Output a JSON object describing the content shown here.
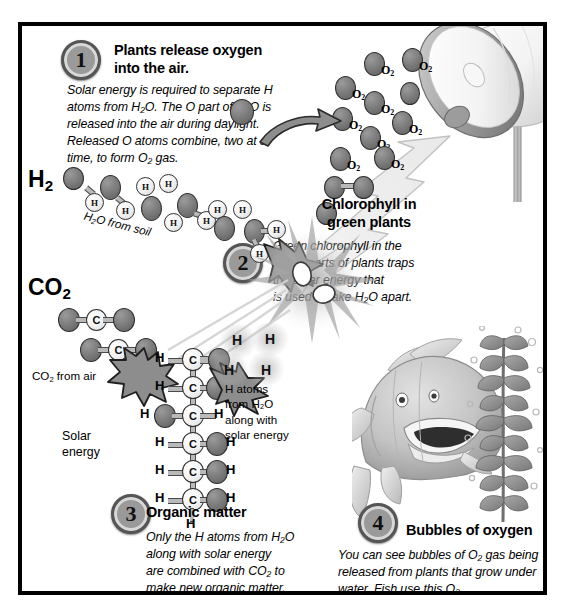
{
  "diagram": {
    "background": "#ffffff",
    "frame_color": "#000000"
  },
  "steps": [
    {
      "number": "1",
      "heading": "Plants release oxygen into the air.",
      "heading_line1": "Plants release oxygen",
      "heading_line2": "into the air.",
      "body_lines": [
        "Solar energy is required to separate H",
        "atoms from H₂O. The O part of H₂O is",
        "released into the air during daylight.",
        "Released O atoms combine, two at a",
        "time, to form O₂ gas."
      ]
    },
    {
      "number": "2",
      "heading": "Chlorophyll in green plants",
      "heading_line1": "Chlorophyll in",
      "heading_line2": "green plants",
      "body_lines": [
        "Green chlorophyll in the",
        "green parts of plants traps",
        "the solar energy that",
        "is used to take H₂O apart."
      ]
    },
    {
      "number": "3",
      "heading": "Organic matter",
      "body_lines": [
        "Only the H atoms from H₂O",
        "along with solar energy",
        "are combined with CO₂ to",
        "make new organic matter."
      ]
    },
    {
      "number": "4",
      "heading": "Bubbles of oxygen",
      "body_lines": [
        "You can see bubbles of O₂ gas being",
        "released from plants that grow under",
        "water. Fish use this O₂."
      ]
    }
  ],
  "labels": {
    "h2_label": "H₂",
    "h2_label_base": "H",
    "h2_label_sub": "2",
    "co2_label": "CO₂",
    "co2_label_base": "CO",
    "co2_label_sub": "2",
    "h2o_from_soil": "H₂O from soil",
    "co2_from_air": "CO₂ from air",
    "solar_energy_line1": "Solar",
    "solar_energy_line2": "energy",
    "h_atoms_caption": [
      "H atoms",
      "from H₂O",
      "along with",
      "solar energy"
    ]
  },
  "molecules": {
    "oxygen_gas_label": "O",
    "oxygen_gas_sub": "2",
    "o2_count_labeled": 8,
    "hydrogen_symbol": "H",
    "carbon_symbol": "C",
    "oxygen_symbol": "O",
    "glucose_rows": [
      {
        "left": "H",
        "center": "C",
        "right": "O",
        "right_h": "",
        "bond": "double"
      },
      {
        "left": "H",
        "center": "C",
        "right": "O",
        "right_h": "H",
        "bond": "single"
      },
      {
        "left": "HO",
        "center": "C",
        "right": "H",
        "right_h": "",
        "bond": "single"
      },
      {
        "left": "H",
        "center": "C",
        "right": "O",
        "right_h": "H",
        "bond": "single"
      },
      {
        "left": "H",
        "center": "C",
        "right": "O",
        "right_h": "H",
        "bond": "single"
      },
      {
        "left": "H",
        "center": "C",
        "right": "O",
        "right_h": "H",
        "bond": "single"
      }
    ],
    "glucose_terminal": "H",
    "free_h_atoms": [
      "H",
      "H",
      "H",
      "H"
    ]
  },
  "illustrations": {
    "lamp": "sun-lamp-dish",
    "lightning_bolt": "solar-energy-bolt",
    "fish": "fish",
    "water_plant": "aquatic-plant",
    "burst": "water-splitting-burst"
  },
  "colors": {
    "oxygen_atom": "#6f6f6f",
    "hydrogen_atom": "#f0f0f0",
    "carbon_atom": "#f2f2f2",
    "arrow_fill": "#8d8d8d",
    "badge_fill": "#9a9a9a",
    "text": "#000000"
  }
}
